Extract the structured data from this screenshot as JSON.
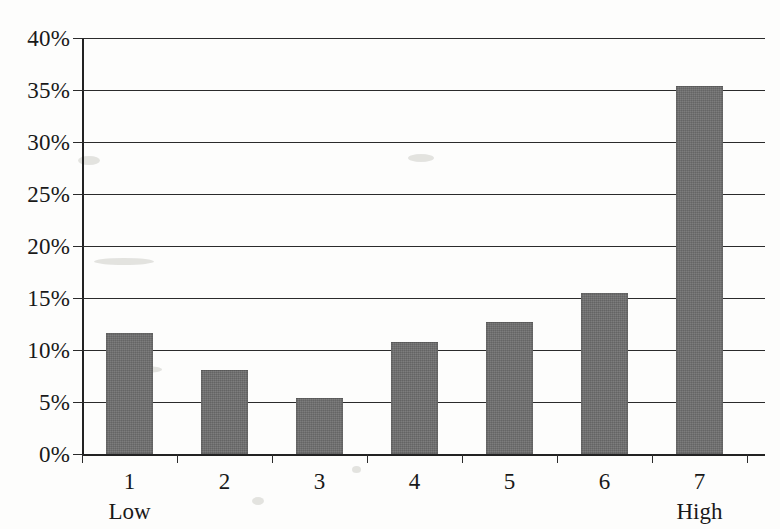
{
  "chart_data": {
    "type": "bar",
    "title": "",
    "subtitle": "",
    "xlabel": "",
    "ylabel": "",
    "categories": [
      "1",
      "2",
      "3",
      "4",
      "5",
      "6",
      "7"
    ],
    "category_endpoint_labels": {
      "first": "Low",
      "last": "High"
    },
    "values": [
      11.6,
      8.1,
      5.4,
      10.8,
      12.7,
      15.5,
      35.4
    ],
    "value_unit": "%",
    "ylim": [
      0,
      40
    ],
    "ytick_step": 5,
    "ytick_labels": [
      "40%",
      "35%",
      "30%",
      "25%",
      "20%",
      "15%",
      "10%",
      "5%",
      "0%"
    ],
    "ytick_values": [
      40,
      35,
      30,
      25,
      20,
      15,
      10,
      5,
      0
    ],
    "grid": true,
    "grid_axis": "y",
    "legend": false,
    "legend_position": "none",
    "bar_color": "#6e6e6e",
    "axis_color": "#222222",
    "background_color": "#fdfdfc",
    "annotations": []
  },
  "axes": {
    "x_tick_labels": [
      {
        "num": "1",
        "sub": "Low"
      },
      {
        "num": "2",
        "sub": ""
      },
      {
        "num": "3",
        "sub": ""
      },
      {
        "num": "4",
        "sub": ""
      },
      {
        "num": "5",
        "sub": ""
      },
      {
        "num": "6",
        "sub": ""
      },
      {
        "num": "7",
        "sub": "High"
      }
    ]
  }
}
